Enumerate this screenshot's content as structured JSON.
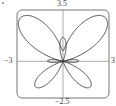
{
  "chart_data": {
    "type": "line",
    "title": "",
    "xlabel": "",
    "ylabel": "",
    "curve": "polar r = e^(sin θ) − 2cos(4θ)",
    "theta_range": [
      0,
      6.2832
    ],
    "xlim": [
      -3,
      3
    ],
    "ylim": [
      -2.5,
      3.5
    ],
    "grid": false,
    "legend": null,
    "tick_labels": {
      "x_min": "−3",
      "x_max": "3",
      "y_min": "−2.5",
      "y_max": "3.5"
    },
    "colors": {
      "curve": "#333333",
      "frame": "#777777",
      "axes": "#888888"
    }
  },
  "labels": {
    "top": "3.5",
    "bottom": "−2.5",
    "left": "−3",
    "right": "3"
  }
}
